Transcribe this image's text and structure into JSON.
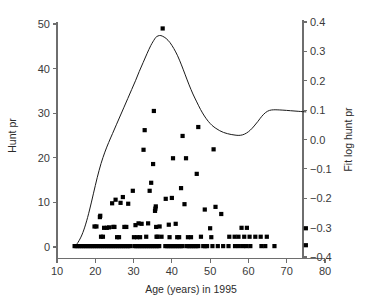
{
  "chart_data": {
    "type": "scatter",
    "title": "",
    "subtitle": "",
    "xlabel": "Age (years) in 1995",
    "ylabel": "Hunt pr",
    "y2label": "Fit log hunt pr",
    "xlim": [
      10,
      80
    ],
    "ylim": [
      0,
      52
    ],
    "y2lim": [
      -0.4,
      0.4
    ],
    "grid": false,
    "legend": null,
    "xticks": [
      10,
      20,
      30,
      40,
      50,
      60,
      70,
      80
    ],
    "xticklabels": [
      "10",
      "20",
      "30",
      "40",
      "50",
      "60",
      "70",
      "80"
    ],
    "yticks": [
      0,
      10,
      20,
      30,
      40,
      50
    ],
    "yticklabels": [
      "0",
      "10",
      "20",
      "30",
      "40",
      "50"
    ],
    "y2ticks": [
      -0.4,
      -0.3,
      -0.2,
      -0.1,
      0.0,
      0.1,
      0.2,
      0.3,
      0.4
    ],
    "y2ticklabels": [
      "−0.4",
      "−0.3",
      "−0.2",
      "−0.1",
      "0.0",
      "0.1",
      "0.2",
      "0.3",
      "0.4"
    ],
    "marker": "square",
    "marker_color": "#000000",
    "line_color": "#1a1a1a",
    "series": [
      {
        "name": "Hunt pr",
        "axis": "left",
        "type": "scatter",
        "points": [
          [
            14.6,
            0.2
          ],
          [
            15.1,
            0.2
          ],
          [
            15.6,
            0.2
          ],
          [
            16.1,
            0.2
          ],
          [
            16.6,
            0.2
          ],
          [
            17.1,
            0.2
          ],
          [
            17.6,
            0.2
          ],
          [
            18.1,
            0.2
          ],
          [
            18.6,
            0.2
          ],
          [
            19.1,
            0.2
          ],
          [
            19.6,
            0.2
          ],
          [
            20.1,
            0.2
          ],
          [
            20.6,
            0.2
          ],
          [
            21.1,
            0.2
          ],
          [
            21.6,
            0.2
          ],
          [
            22.1,
            0.2
          ],
          [
            22.6,
            0.2
          ],
          [
            23.1,
            0.2
          ],
          [
            23.6,
            0.2
          ],
          [
            24.1,
            0.2
          ],
          [
            24.6,
            0.2
          ],
          [
            25.1,
            0.2
          ],
          [
            25.6,
            0.2
          ],
          [
            26.1,
            0.2
          ],
          [
            26.6,
            0.2
          ],
          [
            27.1,
            0.2
          ],
          [
            27.6,
            0.2
          ],
          [
            28.1,
            0.2
          ],
          [
            28.6,
            0.2
          ],
          [
            29.1,
            0.2
          ],
          [
            30.2,
            0.2
          ],
          [
            30.7,
            0.2
          ],
          [
            31.2,
            0.2
          ],
          [
            31.7,
            0.2
          ],
          [
            32.2,
            0.2
          ],
          [
            32.7,
            0.2
          ],
          [
            33.2,
            0.2
          ],
          [
            33.7,
            0.2
          ],
          [
            34.2,
            0.2
          ],
          [
            34.7,
            0.2
          ],
          [
            35.2,
            0.2
          ],
          [
            35.7,
            0.2
          ],
          [
            36.2,
            0.2
          ],
          [
            36.7,
            0.2
          ],
          [
            38.3,
            0.2
          ],
          [
            38.8,
            0.2
          ],
          [
            39.3,
            0.2
          ],
          [
            39.8,
            0.2
          ],
          [
            40.3,
            0.2
          ],
          [
            40.8,
            0.2
          ],
          [
            41.3,
            0.2
          ],
          [
            41.8,
            0.2
          ],
          [
            42.3,
            0.2
          ],
          [
            42.8,
            0.2
          ],
          [
            43.9,
            0.2
          ],
          [
            44.4,
            0.2
          ],
          [
            44.9,
            0.2
          ],
          [
            45.4,
            0.2
          ],
          [
            45.9,
            0.2
          ],
          [
            46.4,
            0.2
          ],
          [
            46.9,
            0.2
          ],
          [
            48.2,
            0.2
          ],
          [
            48.7,
            0.2
          ],
          [
            49.2,
            0.2
          ],
          [
            50.6,
            0.2
          ],
          [
            52.0,
            0.2
          ],
          [
            53.4,
            0.2
          ],
          [
            54.8,
            0.2
          ],
          [
            56.5,
            0.2
          ],
          [
            57.5,
            0.2
          ],
          [
            58.6,
            0.2
          ],
          [
            59.5,
            0.2
          ],
          [
            60.5,
            0.2
          ],
          [
            63.4,
            0.2
          ],
          [
            64.4,
            0.2
          ],
          [
            66.8,
            0.2
          ],
          [
            75.0,
            0.4
          ],
          [
            19.8,
            4.6
          ],
          [
            20.3,
            4.6
          ],
          [
            21.2,
            6.7
          ],
          [
            21.3,
            7.0
          ],
          [
            21.5,
            2.3
          ],
          [
            22.0,
            2.3
          ],
          [
            22.3,
            4.3
          ],
          [
            23.0,
            4.3
          ],
          [
            23.6,
            4.4
          ],
          [
            24.4,
            9.8
          ],
          [
            24.7,
            4.5
          ],
          [
            25.0,
            4.5
          ],
          [
            25.3,
            10.6
          ],
          [
            25.7,
            2.2
          ],
          [
            26.2,
            2.2
          ],
          [
            26.6,
            9.9
          ],
          [
            27.2,
            11.2
          ],
          [
            27.6,
            4.5
          ],
          [
            28.1,
            4.5
          ],
          [
            28.6,
            9.7
          ],
          [
            29.8,
            12.6
          ],
          [
            30.1,
            2.2
          ],
          [
            30.5,
            4.9
          ],
          [
            30.9,
            2.2
          ],
          [
            31.3,
            5.3
          ],
          [
            31.7,
            2.2
          ],
          [
            32.1,
            5.2
          ],
          [
            32.6,
            21.8
          ],
          [
            32.9,
            26.2
          ],
          [
            33.3,
            2.3
          ],
          [
            33.8,
            5.3
          ],
          [
            34.2,
            12.6
          ],
          [
            34.6,
            14.4
          ],
          [
            35.1,
            18.6
          ],
          [
            35.3,
            30.5
          ],
          [
            35.6,
            8.1
          ],
          [
            35.7,
            8.6
          ],
          [
            35.8,
            9.1
          ],
          [
            35.9,
            4.5
          ],
          [
            36.0,
            2.3
          ],
          [
            36.3,
            2.3
          ],
          [
            36.8,
            4.6
          ],
          [
            37.3,
            2.3
          ],
          [
            37.6,
            49.0
          ],
          [
            38.4,
            10.8
          ],
          [
            39.2,
            5.0
          ],
          [
            39.4,
            2.2
          ],
          [
            40.0,
            11.0
          ],
          [
            40.3,
            19.9
          ],
          [
            41.0,
            5.2
          ],
          [
            41.4,
            2.2
          ],
          [
            41.9,
            2.2
          ],
          [
            42.4,
            13.2
          ],
          [
            42.8,
            24.9
          ],
          [
            43.3,
            9.6
          ],
          [
            43.7,
            19.9
          ],
          [
            44.2,
            2.2
          ],
          [
            45.0,
            2.2
          ],
          [
            46.5,
            16.4
          ],
          [
            46.9,
            26.9
          ],
          [
            47.6,
            2.3
          ],
          [
            48.6,
            8.4
          ],
          [
            50.0,
            4.2
          ],
          [
            50.3,
            2.2
          ],
          [
            50.9,
            21.9
          ],
          [
            51.4,
            9.0
          ],
          [
            52.9,
            7.4
          ],
          [
            55.0,
            2.3
          ],
          [
            56.4,
            2.3
          ],
          [
            57.4,
            2.3
          ],
          [
            58.2,
            4.3
          ],
          [
            58.9,
            2.3
          ],
          [
            59.6,
            4.3
          ],
          [
            60.3,
            2.3
          ],
          [
            61.8,
            2.3
          ],
          [
            63.2,
            2.3
          ],
          [
            64.8,
            2.3
          ],
          [
            75.0,
            4.2
          ]
        ]
      },
      {
        "name": "Fit log hunt pr",
        "axis": "right",
        "type": "line",
        "points": [
          [
            14.6,
            -0.365
          ],
          [
            15.5,
            -0.35
          ],
          [
            16.5,
            -0.325
          ],
          [
            17.5,
            -0.288
          ],
          [
            18.5,
            -0.24
          ],
          [
            19.5,
            -0.185
          ],
          [
            20.5,
            -0.13
          ],
          [
            21.5,
            -0.082
          ],
          [
            22.5,
            -0.043
          ],
          [
            23.5,
            -0.01
          ],
          [
            24.5,
            0.02
          ],
          [
            25.5,
            0.05
          ],
          [
            26.5,
            0.08
          ],
          [
            27.5,
            0.11
          ],
          [
            28.5,
            0.14
          ],
          [
            29.5,
            0.17
          ],
          [
            30.5,
            0.2
          ],
          [
            31.5,
            0.232
          ],
          [
            32.5,
            0.262
          ],
          [
            33.5,
            0.292
          ],
          [
            34.5,
            0.32
          ],
          [
            35.5,
            0.342
          ],
          [
            36.0,
            0.35
          ],
          [
            36.8,
            0.354
          ],
          [
            37.5,
            0.352
          ],
          [
            38.5,
            0.344
          ],
          [
            39.5,
            0.33
          ],
          [
            40.5,
            0.31
          ],
          [
            41.5,
            0.285
          ],
          [
            42.5,
            0.254
          ],
          [
            43.5,
            0.22
          ],
          [
            44.5,
            0.186
          ],
          [
            45.5,
            0.155
          ],
          [
            46.5,
            0.128
          ],
          [
            47.5,
            0.102
          ],
          [
            48.5,
            0.08
          ],
          [
            49.5,
            0.062
          ],
          [
            50.5,
            0.048
          ],
          [
            51.5,
            0.038
          ],
          [
            52.5,
            0.03
          ],
          [
            53.5,
            0.024
          ],
          [
            54.5,
            0.02
          ],
          [
            55.5,
            0.017
          ],
          [
            56.5,
            0.015
          ],
          [
            57.5,
            0.014
          ],
          [
            58.5,
            0.016
          ],
          [
            59.5,
            0.022
          ],
          [
            60.5,
            0.032
          ],
          [
            61.5,
            0.046
          ],
          [
            62.5,
            0.062
          ],
          [
            63.5,
            0.079
          ],
          [
            64.5,
            0.092
          ],
          [
            65.5,
            0.099
          ],
          [
            66.5,
            0.101
          ],
          [
            67.5,
            0.101
          ],
          [
            69.0,
            0.1
          ],
          [
            71.0,
            0.098
          ],
          [
            73.0,
            0.096
          ],
          [
            75.0,
            0.094
          ]
        ]
      }
    ]
  }
}
